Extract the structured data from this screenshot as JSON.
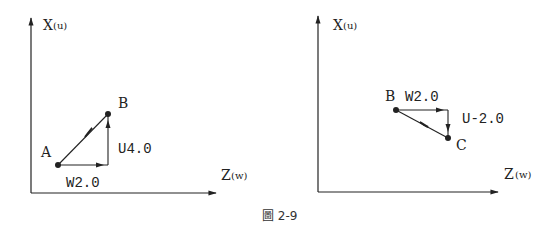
{
  "caption": "圖 2-9",
  "colors": {
    "line": "#222222",
    "background": "#ffffff"
  },
  "left_panel": {
    "x_axis_label": "X",
    "x_axis_sub": "(u)",
    "z_axis_label": "Z",
    "z_axis_sub": "(w)",
    "point_start": "A",
    "point_end": "B",
    "horizontal_label": "W2.0",
    "vertical_label": "U4.0"
  },
  "right_panel": {
    "x_axis_label": "X",
    "x_axis_sub": "(u)",
    "z_axis_label": "Z",
    "z_axis_sub": "(w)",
    "point_start": "B",
    "point_end": "C",
    "horizontal_label": "W2.0",
    "vertical_label": "U-2.0"
  }
}
